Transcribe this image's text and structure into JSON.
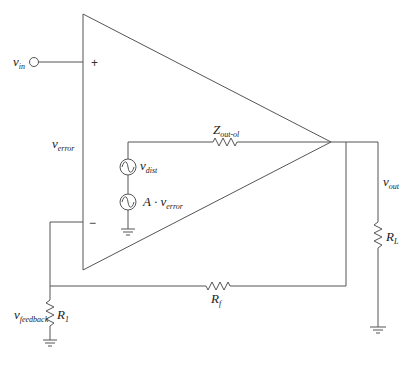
{
  "diagram": {
    "type": "op-amp feedback circuit model",
    "colors": {
      "stroke": "#555555",
      "text": "#222222",
      "background": "#ffffff"
    },
    "opamp": {
      "plus_sign": "+",
      "minus_sign": "−"
    },
    "labels": {
      "v_in": {
        "main": "v",
        "sub": "in"
      },
      "v_error": {
        "main": "v",
        "sub": "error"
      },
      "z_out": {
        "main": "Z",
        "sub": "out-ol"
      },
      "v_dist": {
        "main": "v",
        "sub": "dist"
      },
      "gain_source": {
        "main": "A · v",
        "sub": "error"
      },
      "v_out": {
        "main": "v",
        "sub": "out"
      },
      "r_l": {
        "main": "R",
        "sub": "L"
      },
      "r_f": {
        "main": "R",
        "sub": "f"
      },
      "v_feedback": {
        "main": "v",
        "sub": "feedback"
      },
      "r_1": {
        "main": "R",
        "sub": "1"
      }
    },
    "components": [
      {
        "id": "opamp-triangle",
        "kind": "amplifier"
      },
      {
        "id": "input-terminal",
        "kind": "terminal"
      },
      {
        "id": "v-dist-source",
        "kind": "ac-source"
      },
      {
        "id": "gain-source",
        "kind": "ac-source"
      },
      {
        "id": "z-out-resistor",
        "kind": "resistor"
      },
      {
        "id": "r-l-resistor",
        "kind": "resistor"
      },
      {
        "id": "r-f-resistor",
        "kind": "resistor"
      },
      {
        "id": "r-1-resistor",
        "kind": "resistor"
      },
      {
        "id": "ground-internal",
        "kind": "ground"
      },
      {
        "id": "ground-load",
        "kind": "ground"
      },
      {
        "id": "ground-r1",
        "kind": "ground"
      }
    ]
  }
}
